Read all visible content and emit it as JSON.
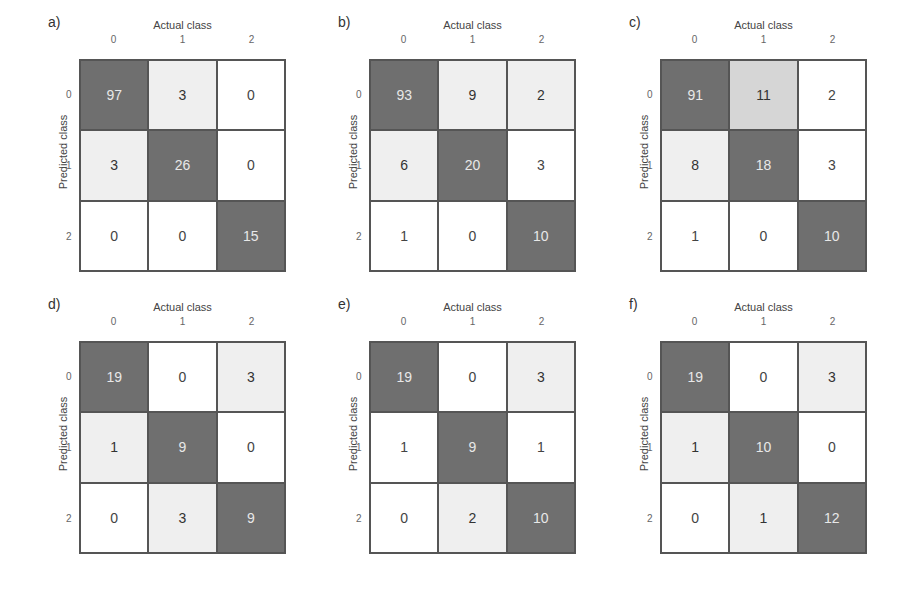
{
  "chart_data": [
    {
      "type": "heatmap",
      "panel": "a)",
      "xlabel": "Actual class",
      "ylabel": "Predicted class",
      "x_ticks": [
        "0",
        "1",
        "2"
      ],
      "y_ticks": [
        "0",
        "1",
        "2"
      ],
      "values": [
        [
          97,
          3,
          0
        ],
        [
          3,
          26,
          0
        ],
        [
          0,
          0,
          15
        ]
      ],
      "shades": [
        [
          "dark",
          "light",
          "white"
        ],
        [
          "light",
          "dark",
          "white"
        ],
        [
          "white",
          "white",
          "dark"
        ]
      ]
    },
    {
      "type": "heatmap",
      "panel": "b)",
      "xlabel": "Actual class",
      "ylabel": "Predicted class",
      "x_ticks": [
        "0",
        "1",
        "2"
      ],
      "y_ticks": [
        "0",
        "1",
        "2"
      ],
      "values": [
        [
          93,
          9,
          2
        ],
        [
          6,
          20,
          3
        ],
        [
          1,
          0,
          10
        ]
      ],
      "shades": [
        [
          "dark",
          "light",
          "light"
        ],
        [
          "light",
          "dark",
          "white"
        ],
        [
          "white",
          "white",
          "dark"
        ]
      ]
    },
    {
      "type": "heatmap",
      "panel": "c)",
      "xlabel": "Actual class",
      "ylabel": "Predicted class",
      "x_ticks": [
        "0",
        "1",
        "2"
      ],
      "y_ticks": [
        "0",
        "1",
        "2"
      ],
      "values": [
        [
          91,
          11,
          2
        ],
        [
          8,
          18,
          3
        ],
        [
          1,
          0,
          10
        ]
      ],
      "shades": [
        [
          "dark",
          "mid",
          "white"
        ],
        [
          "light",
          "dark",
          "white"
        ],
        [
          "white",
          "white",
          "dark"
        ]
      ]
    },
    {
      "type": "heatmap",
      "panel": "d)",
      "xlabel": "Actual class",
      "ylabel": "Predicted class",
      "x_ticks": [
        "0",
        "1",
        "2"
      ],
      "y_ticks": [
        "0",
        "1",
        "2"
      ],
      "values": [
        [
          19,
          0,
          3
        ],
        [
          1,
          9,
          0
        ],
        [
          0,
          3,
          9
        ]
      ],
      "shades": [
        [
          "dark",
          "white",
          "light"
        ],
        [
          "light",
          "dark",
          "white"
        ],
        [
          "white",
          "light",
          "dark"
        ]
      ]
    },
    {
      "type": "heatmap",
      "panel": "e)",
      "xlabel": "Actual class",
      "ylabel": "Predicted class",
      "x_ticks": [
        "0",
        "1",
        "2"
      ],
      "y_ticks": [
        "0",
        "1",
        "2"
      ],
      "values": [
        [
          19,
          0,
          3
        ],
        [
          1,
          9,
          1
        ],
        [
          0,
          2,
          10
        ]
      ],
      "shades": [
        [
          "dark",
          "white",
          "light"
        ],
        [
          "white",
          "dark",
          "white"
        ],
        [
          "white",
          "light",
          "dark"
        ]
      ]
    },
    {
      "type": "heatmap",
      "panel": "f)",
      "xlabel": "Actual class",
      "ylabel": "Predicted class",
      "x_ticks": [
        "0",
        "1",
        "2"
      ],
      "y_ticks": [
        "0",
        "1",
        "2"
      ],
      "values": [
        [
          19,
          0,
          3
        ],
        [
          1,
          10,
          0
        ],
        [
          0,
          1,
          12
        ]
      ],
      "shades": [
        [
          "dark",
          "white",
          "light"
        ],
        [
          "light",
          "dark",
          "white"
        ],
        [
          "white",
          "light",
          "dark"
        ]
      ]
    }
  ],
  "colors": {
    "dark": "#6f6f6f",
    "mid": "#d6d6d6",
    "light": "#efefef",
    "white": "#ffffff"
  },
  "layout": {
    "positions": [
      [
        48,
        14
      ],
      [
        338,
        14
      ],
      [
        629,
        14
      ],
      [
        48,
        296
      ],
      [
        338,
        296
      ],
      [
        629,
        296
      ]
    ]
  }
}
